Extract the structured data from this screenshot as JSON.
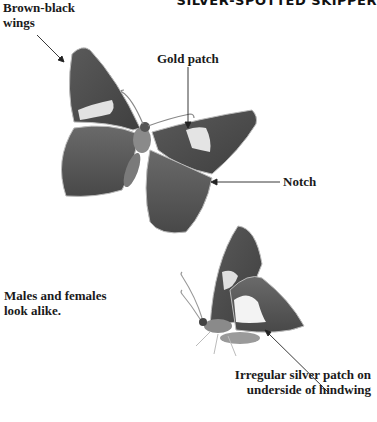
{
  "title": "SILVER-SPOTTED SKIPPER",
  "labels": {
    "wings": [
      "Brown-black",
      "wings"
    ],
    "gold_patch": "Gold patch",
    "notch": "Notch",
    "males": [
      "Males and females",
      "look alike."
    ],
    "silver": [
      "Irregular silver patch on",
      "underside of hindwing"
    ]
  },
  "colors": {
    "background": "#ffffff",
    "wing_dark": "#4a4a4a",
    "wing_mid": "#6e6e6e",
    "patch": "#e4e4e4",
    "text": "#1a1a1a"
  }
}
